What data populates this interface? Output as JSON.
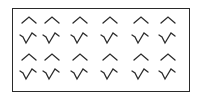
{
  "figure": {
    "stroke_color": "#2b2b2b",
    "background": "#ffffff",
    "columns_x": [
      29,
      52,
      80,
      110,
      141,
      168
    ],
    "rows": [
      {
        "type": "caret",
        "label": "^",
        "y": 20,
        "count": 6
      },
      {
        "type": "check-caret",
        "label": "√^",
        "y": 38,
        "count": 6
      },
      {
        "type": "caret",
        "label": "^",
        "y": 57,
        "count": 6
      },
      {
        "type": "check-caret",
        "label": "√^",
        "y": 74,
        "count": 6
      }
    ]
  }
}
